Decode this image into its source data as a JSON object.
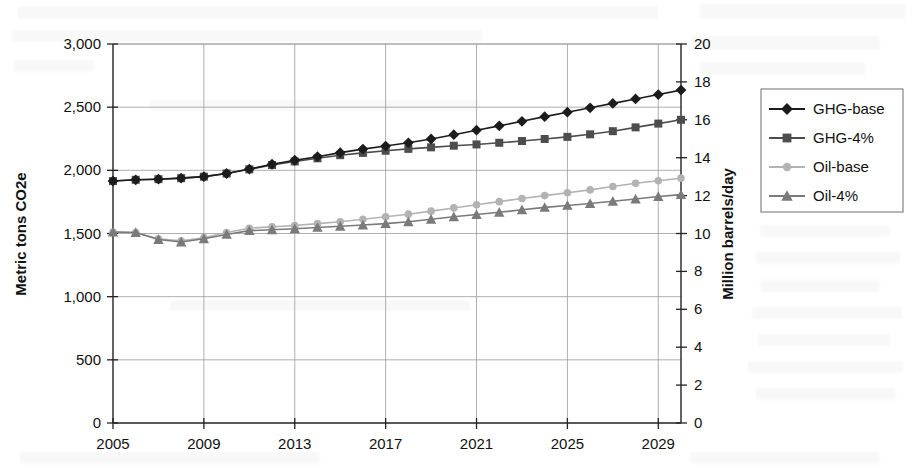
{
  "chart_data": {
    "type": "line",
    "title": "",
    "xlabel": "",
    "ylabel": "Metric tons CO2e",
    "y2label": "Million barrels/day",
    "x": [
      2005,
      2006,
      2007,
      2008,
      2009,
      2010,
      2011,
      2012,
      2013,
      2014,
      2015,
      2016,
      2017,
      2018,
      2019,
      2020,
      2021,
      2022,
      2023,
      2024,
      2025,
      2026,
      2027,
      2028,
      2029,
      2030
    ],
    "xlim": [
      2005,
      2030
    ],
    "ylim": [
      0,
      3000
    ],
    "y2lim": [
      0,
      20
    ],
    "yticks": [
      0,
      500,
      1000,
      1500,
      2000,
      2500,
      3000
    ],
    "ytick_labels": [
      "0",
      "500",
      "1,000",
      "1,500",
      "2,000",
      "2,500",
      "3,000"
    ],
    "y2ticks": [
      0,
      2,
      4,
      6,
      8,
      10,
      12,
      14,
      16,
      18,
      20
    ],
    "y2tick_labels": [
      "0",
      "2",
      "4",
      "6",
      "8",
      "10",
      "12",
      "14",
      "16",
      "18",
      "20"
    ],
    "xticks": [
      2005,
      2009,
      2013,
      2017,
      2021,
      2025,
      2029
    ],
    "xtick_labels": [
      "2005",
      "2009",
      "2013",
      "2017",
      "2021",
      "2025",
      "2029"
    ],
    "grid": true,
    "legend_position": "right",
    "series": [
      {
        "name": "GHG-base",
        "axis": "left",
        "marker": "diamond",
        "color": "#1c1c1c",
        "values": [
          1915,
          1925,
          1930,
          1938,
          1950,
          1975,
          2010,
          2048,
          2080,
          2108,
          2140,
          2168,
          2192,
          2218,
          2248,
          2282,
          2318,
          2352,
          2388,
          2425,
          2460,
          2495,
          2530,
          2565,
          2600,
          2635
        ]
      },
      {
        "name": "GHG-4%",
        "axis": "left",
        "marker": "square",
        "color": "#4d4d4d",
        "values": [
          1915,
          1925,
          1930,
          1938,
          1950,
          1975,
          2008,
          2042,
          2070,
          2095,
          2120,
          2138,
          2155,
          2170,
          2182,
          2195,
          2205,
          2218,
          2232,
          2248,
          2265,
          2285,
          2310,
          2340,
          2370,
          2400
        ]
      },
      {
        "name": "Oil-base",
        "axis": "right",
        "marker": "circle",
        "color": "#b3b3b3",
        "values": [
          10.08,
          10.05,
          9.72,
          9.62,
          9.78,
          10.05,
          10.28,
          10.35,
          10.42,
          10.52,
          10.62,
          10.75,
          10.88,
          11.02,
          11.18,
          11.35,
          11.52,
          11.68,
          11.85,
          12.0,
          12.15,
          12.3,
          12.48,
          12.65,
          12.78,
          12.92
        ]
      },
      {
        "name": "Oil-4%",
        "axis": "right",
        "marker": "triangle",
        "color": "#7a7a7a",
        "values": [
          10.08,
          10.05,
          9.68,
          9.55,
          9.72,
          9.95,
          10.15,
          10.2,
          10.25,
          10.32,
          10.38,
          10.45,
          10.52,
          10.62,
          10.75,
          10.88,
          11.0,
          11.12,
          11.25,
          11.38,
          11.48,
          11.58,
          11.7,
          11.82,
          11.95,
          12.05
        ]
      }
    ]
  },
  "legend": {
    "entries": [
      {
        "label": "GHG-base"
      },
      {
        "label": "GHG-4%"
      },
      {
        "label": "Oil-base"
      },
      {
        "label": "Oil-4%"
      }
    ]
  }
}
